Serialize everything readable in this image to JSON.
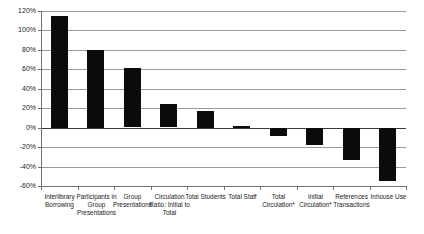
{
  "chart_data": {
    "type": "bar",
    "title": "",
    "subtitle": "",
    "xlabel": "",
    "ylabel": "",
    "categories": [
      "Interlibrary Borrowing",
      "Participants in Group Presentations",
      "Group Presentations",
      "Circulation Ratio: Initial to Total",
      "Total Students",
      "Total Staff",
      "Total Circulation*",
      "Initial Circulation*",
      "References Transactions",
      "Inhouse Use"
    ],
    "values": [
      115,
      80,
      61,
      24,
      17,
      2,
      -8,
      -17,
      -33,
      -55
    ],
    "ylim": [
      -60,
      120
    ],
    "ytick_step": 20,
    "ytick_labels": [
      "120%",
      "100%",
      "80%",
      "60%",
      "40%",
      "20%",
      "0%",
      "-20%",
      "-40%",
      "-60%"
    ],
    "ytick_values": [
      120,
      100,
      80,
      60,
      40,
      20,
      0,
      -20,
      -40,
      -60
    ],
    "grid": true,
    "legend": null,
    "legend_position": "none",
    "bar_color": "#0b0b0b",
    "gridline_color": "#9a9a9a",
    "axis_color": "#6f6f6f",
    "zero_line_color": "#3a3a3a",
    "annotations": []
  }
}
